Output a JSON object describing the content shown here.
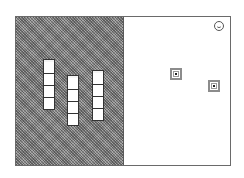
{
  "game": {
    "left_panel": {
      "pattern": "dithered-gray",
      "stacks": [
        {
          "id": "stack-1",
          "cube_count": 4,
          "left": 27,
          "top": 42
        },
        {
          "id": "stack-2",
          "cube_count": 4,
          "left": 51,
          "top": 58
        },
        {
          "id": "stack-3",
          "cube_count": 4,
          "left": 76,
          "top": 53
        }
      ]
    },
    "right_panel": {
      "targets": [
        {
          "id": "target-1",
          "left": 46,
          "top": 51
        },
        {
          "id": "target-2",
          "left": 84,
          "top": 63
        }
      ],
      "status_icon": "smiley-icon"
    },
    "colors": {
      "frame_border": "#6a6a6a",
      "panel_pattern": "#8a8a8a",
      "cube_fill": "#ffffff",
      "cube_outline": "#333333",
      "target_border": "#8c8c8c"
    }
  }
}
